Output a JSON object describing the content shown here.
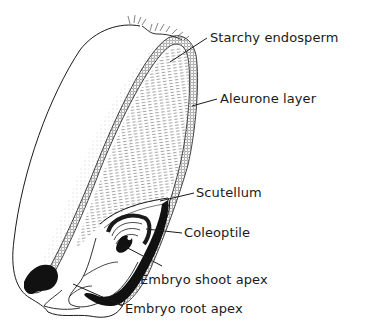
{
  "diagram": {
    "colors": {
      "ink": "#1a1a1a",
      "stipple": "#555555",
      "background": "#ffffff"
    },
    "labels": [
      {
        "id": "starchy-endosperm",
        "text": "Starchy endosperm",
        "x": 210,
        "y": 31
      },
      {
        "id": "aleurone-layer",
        "text": "Aleurone layer",
        "x": 220,
        "y": 92
      },
      {
        "id": "scutellum",
        "text": "Scutellum",
        "x": 196,
        "y": 186
      },
      {
        "id": "coleoptile",
        "text": "Coleoptile",
        "x": 184,
        "y": 226
      },
      {
        "id": "embryo-shoot-apex",
        "text": "Embryo shoot apex",
        "x": 140,
        "y": 274
      },
      {
        "id": "embryo-root-apex",
        "text": "Embryo root apex",
        "x": 125,
        "y": 303
      }
    ]
  }
}
